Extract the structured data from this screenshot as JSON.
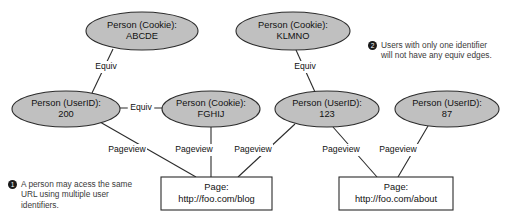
{
  "diagram": {
    "colors": {
      "node_fill": "#c0c0c0",
      "page_fill": "#ffffff",
      "stroke": "#2b2b2b",
      "text": "#111111",
      "note_text": "#3a3a3a",
      "marker_fill": "#1a1a1a"
    },
    "person_nodes": [
      {
        "id": "cookie-abcde",
        "line1": "Person (Cookie):",
        "line2": "ABCDE",
        "cx": 142,
        "cy": 31,
        "rx": 56,
        "ry": 19
      },
      {
        "id": "cookie-klmno",
        "line1": "Person (Cookie):",
        "line2": "KLMNO",
        "cx": 293,
        "cy": 31,
        "rx": 57,
        "ry": 19
      },
      {
        "id": "userid-200",
        "line1": "Person (UserID):",
        "line2": "200",
        "cx": 66,
        "cy": 109,
        "rx": 54,
        "ry": 18
      },
      {
        "id": "cookie-fghij",
        "line1": "Person (Cookie):",
        "line2": "FGHIJ",
        "cx": 211,
        "cy": 109,
        "rx": 49,
        "ry": 18
      },
      {
        "id": "userid-123",
        "line1": "Person (UserID):",
        "line2": "123",
        "cx": 327,
        "cy": 109,
        "rx": 52,
        "ry": 18
      },
      {
        "id": "userid-87",
        "line1": "Person (UserID):",
        "line2": "87",
        "cx": 447,
        "cy": 109,
        "rx": 52,
        "ry": 18
      }
    ],
    "page_nodes": [
      {
        "id": "page-blog",
        "line1": "Page:",
        "line2": "http://foo.com/blog",
        "x": 161,
        "y": 177,
        "w": 111,
        "h": 33
      },
      {
        "id": "page-about",
        "line1": "Page:",
        "line2": "http://foo.com/about",
        "x": 339,
        "y": 177,
        "w": 114,
        "h": 33
      }
    ],
    "edges": [
      {
        "id": "equiv-abcde-200",
        "label": "Equiv",
        "x1": 113,
        "y1": 49,
        "x2": 92,
        "y2": 93,
        "lx": 106,
        "ly": 67
      },
      {
        "id": "equiv-200-fghij",
        "label": "Equiv",
        "x1": 120,
        "y1": 108,
        "x2": 162,
        "y2": 108,
        "lx": 141,
        "ly": 108
      },
      {
        "id": "equiv-klmno-123",
        "label": "Equiv",
        "x1": 296,
        "y1": 50,
        "x2": 315,
        "y2": 92,
        "lx": 305,
        "ly": 67
      },
      {
        "id": "pageview-200-blog",
        "label": "Pageview",
        "x1": 100,
        "y1": 122,
        "x2": 196,
        "y2": 177,
        "lx": 127,
        "ly": 150
      },
      {
        "id": "pageview-fghij-blog",
        "label": "Pageview",
        "x1": 211,
        "y1": 127,
        "x2": 211,
        "y2": 177,
        "lx": 194,
        "ly": 150
      },
      {
        "id": "pageview-123-blog",
        "label": "Pageview",
        "x1": 295,
        "y1": 124,
        "x2": 238,
        "y2": 177,
        "lx": 253,
        "ly": 150
      },
      {
        "id": "pageview-123-about",
        "label": "Pageview",
        "x1": 333,
        "y1": 127,
        "x2": 377,
        "y2": 177,
        "lx": 341,
        "ly": 150
      },
      {
        "id": "pageview-87-about",
        "label": "Pageview",
        "x1": 428,
        "y1": 126,
        "x2": 398,
        "y2": 177,
        "lx": 398,
        "ly": 150
      }
    ],
    "notes": [
      {
        "id": "note-1",
        "marker": "1",
        "text": "A person may acess the same URL using multiple user identifiers."
      },
      {
        "id": "note-2",
        "marker": "2",
        "text": "Users with only one identifier will not have any equiv edges."
      }
    ]
  }
}
